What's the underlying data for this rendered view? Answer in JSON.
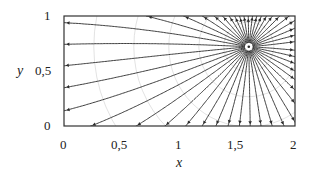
{
  "chart_data": {
    "type": "streamplot",
    "title": "",
    "xlabel": "x",
    "ylabel": "y",
    "xlim": [
      0,
      2
    ],
    "ylim": [
      0,
      1
    ],
    "x_ticks": [
      {
        "value": 0,
        "label": "0"
      },
      {
        "value": 0.5,
        "label": "0,5"
      },
      {
        "value": 1,
        "label": "1"
      },
      {
        "value": 1.5,
        "label": "1,5"
      },
      {
        "value": 2,
        "label": "2"
      }
    ],
    "y_ticks": [
      {
        "value": 0,
        "label": "0"
      },
      {
        "value": 0.5,
        "label": "0,5"
      },
      {
        "value": 1,
        "label": "1"
      }
    ],
    "grid": "concentric circles around source (faint gray)",
    "source_point": {
      "x": 1.6,
      "y": 0.72
    },
    "colors": {
      "lines": "#2a2a2a",
      "frame": "#333333",
      "grid": "#cfcfcf"
    }
  },
  "labels": {
    "x_axis": "x",
    "y_axis": "y",
    "x0": "0",
    "x05": "0,5",
    "x1": "1",
    "x15": "1,5",
    "x2": "2",
    "y0": "0",
    "y05": "0,5",
    "y1": "1"
  }
}
